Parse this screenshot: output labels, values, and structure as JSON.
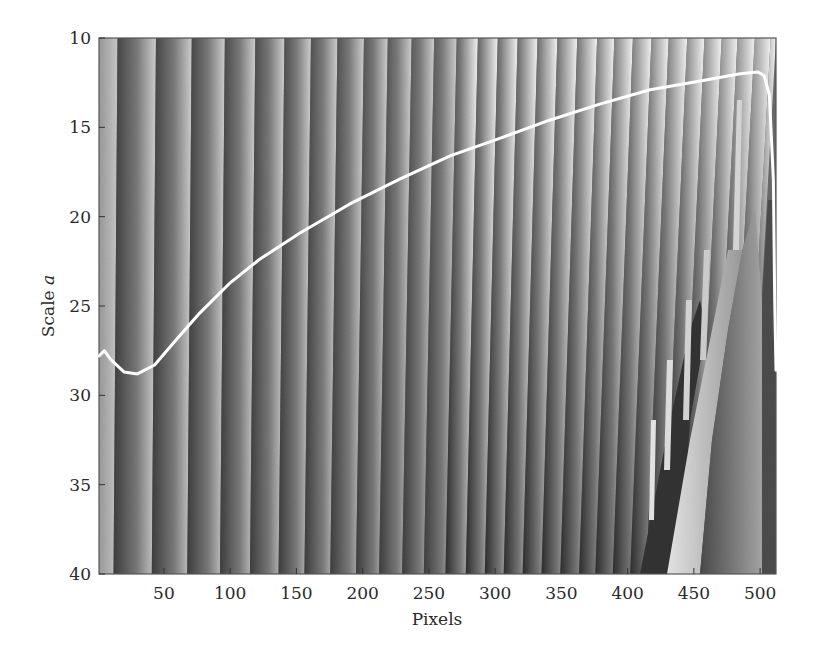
{
  "chart_data": {
    "type": "heatmap",
    "subtype": "wavelet-phase-scalogram-with-ridge-line",
    "title": "",
    "xlabel": "Pixels",
    "ylabel": "Scale a",
    "ylabel_parts": {
      "text": "Scale ",
      "italic": "a"
    },
    "xlim": [
      1,
      512
    ],
    "ylim": [
      10,
      40
    ],
    "y_inverted": true,
    "grid": false,
    "legend": null,
    "x_ticks": [
      50,
      100,
      150,
      200,
      250,
      300,
      350,
      400,
      450,
      500
    ],
    "y_ticks": [
      10,
      15,
      20,
      25,
      30,
      35,
      40
    ],
    "colormap": "gray",
    "stripe_boundaries_px_at_scale_10": [
      15,
      44,
      71,
      96,
      119,
      141,
      161,
      181,
      201,
      219,
      237,
      254,
      271,
      287,
      302,
      317,
      332,
      347,
      362,
      377,
      390,
      404,
      418,
      431,
      445,
      458,
      471,
      483,
      496,
      508
    ],
    "ridge_line": {
      "color": "#ffffff",
      "x": [
        1,
        5,
        10,
        20,
        30,
        43,
        58,
        77,
        100,
        122,
        153,
        190,
        228,
        266,
        304,
        341,
        379,
        417,
        455,
        485,
        498,
        503,
        507,
        510,
        511,
        512
      ],
      "y": [
        27.8,
        27.5,
        28.0,
        28.7,
        28.8,
        28.3,
        27.0,
        25.4,
        23.7,
        22.4,
        20.9,
        19.3,
        17.9,
        16.6,
        15.6,
        14.6,
        13.7,
        12.9,
        12.4,
        12.0,
        11.9,
        12.1,
        13.2,
        18.0,
        24.7,
        28.6
      ]
    }
  },
  "axes": {
    "x_label": "Pixels",
    "y_label_prefix": "Scale ",
    "y_label_var": "a",
    "x_tick_labels": [
      "50",
      "100",
      "150",
      "200",
      "250",
      "300",
      "350",
      "400",
      "450",
      "500"
    ],
    "y_tick_labels": [
      "10",
      "15",
      "20",
      "25",
      "30",
      "35",
      "40"
    ]
  }
}
